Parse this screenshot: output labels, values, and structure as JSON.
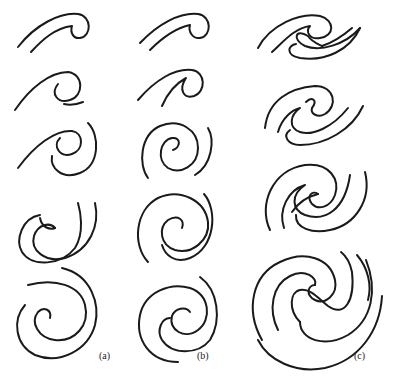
{
  "figure": {
    "stroke_color": "#1a1a1a",
    "background": "#ffffff",
    "columns": [
      {
        "label": "(a)",
        "stages": 5,
        "type": "single-arm spiral roll-up"
      },
      {
        "label": "(b)",
        "stages": 5,
        "type": "single-arm spiral roll-up (variant)"
      },
      {
        "label": "(c)",
        "stages": 4,
        "type": "double-arm (two-armed) spiral roll-up"
      }
    ]
  }
}
